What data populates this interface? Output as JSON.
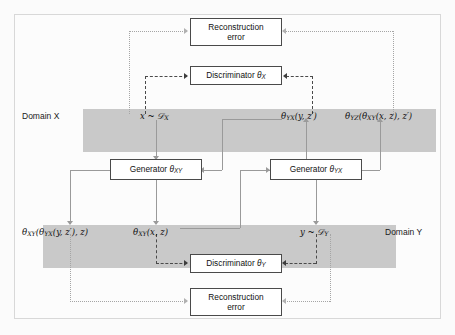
{
  "figure": {
    "type": "diagram",
    "domains": [
      {
        "id": "x",
        "label": "Domain X"
      },
      {
        "id": "y",
        "label": "Domain Y"
      }
    ],
    "boxes": [
      {
        "id": "recon-top",
        "line1": "Reconstruction",
        "line2": "error"
      },
      {
        "id": "disc-x",
        "label": "Discriminator",
        "param": "θ",
        "param_sub": "X"
      },
      {
        "id": "gen-xy",
        "label": "Generator",
        "param": "θ",
        "param_sub": "XY"
      },
      {
        "id": "gen-yx",
        "label": "Generator",
        "param": "θ",
        "param_sub": "YX"
      },
      {
        "id": "disc-y",
        "label": "Discriminator",
        "param": "θ",
        "param_sub": "Y"
      },
      {
        "id": "recon-bot",
        "line1": "Reconstruction",
        "line2": "error"
      }
    ],
    "expressions": [
      {
        "id": "x-sample",
        "text": "x ~ 𝒟X",
        "domain": "x"
      },
      {
        "id": "theta-yx-y-zp",
        "text": "θYX(y, z′)",
        "domain": "x"
      },
      {
        "id": "theta-yz-of-theta-xy",
        "text": "θYZ(θXY(x, z), z′)",
        "domain": "x"
      },
      {
        "id": "theta-xy-of-theta-yx",
        "text": "θXY(θYX(y, z′), z)",
        "domain": "y"
      },
      {
        "id": "theta-xy-x-z",
        "text": "θXY(x, z)",
        "domain": "y"
      },
      {
        "id": "y-sample",
        "text": "y ~ 𝒟Y",
        "domain": "y"
      }
    ],
    "colors": {
      "band": "#c9c9c9",
      "box_border": "#4a4a4a",
      "solid_line": "#9a9a9a",
      "dashed_line": "#4a4a4a",
      "dotted_line": "#a5a5a5",
      "background": "#fcfcfc",
      "frame_border": "#d8d8d8"
    }
  },
  "labels": {
    "domain_x": "Domain X",
    "domain_y": "Domain Y",
    "reconstruction": "Reconstruction",
    "error": "error",
    "discriminator": "Discriminator",
    "generator": "Generator",
    "theta": "θ",
    "sub_x": "X",
    "sub_y": "Y",
    "sub_xy": "XY",
    "sub_yx": "YX",
    "sub_yz": "YZ"
  }
}
